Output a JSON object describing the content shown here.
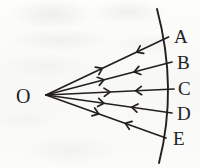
{
  "figure": {
    "ink_color": "#231f1e",
    "paper_color": "#fbfbfa"
  },
  "source_point": {
    "label": "O",
    "label_x": 16,
    "label_y": 86,
    "vertex_x": 46,
    "vertex_y": 95
  },
  "arc": {
    "name": "wavefront-arc",
    "path": "M 157 9 Q 178 88 159 163",
    "stroke_width": 1.9
  },
  "rays": [
    {
      "id": "ray-A",
      "label": "A",
      "x1": 46,
      "y1": 95,
      "x2": 168.5,
      "y2": 37,
      "arrow_out_t": 0.46,
      "arrow_in_t": 0.74,
      "label_x": 174,
      "label_y": 27,
      "label_size": 19
    },
    {
      "id": "ray-B",
      "label": "B",
      "x1": 46,
      "y1": 95,
      "x2": 172,
      "y2": 62,
      "arrow_out_t": 0.46,
      "arrow_in_t": 0.7,
      "label_x": 177,
      "label_y": 53,
      "label_size": 19
    },
    {
      "id": "ray-C",
      "label": "C",
      "x1": 46,
      "y1": 95,
      "x2": 174,
      "y2": 89,
      "arrow_out_t": 0.5,
      "arrow_in_t": 0.7,
      "label_x": 178,
      "label_y": 79,
      "label_size": 19
    },
    {
      "id": "ray-D",
      "label": "D",
      "x1": 46,
      "y1": 95,
      "x2": 172,
      "y2": 113,
      "arrow_out_t": 0.46,
      "arrow_in_t": 0.68,
      "label_x": 177,
      "label_y": 104,
      "label_size": 19
    },
    {
      "id": "ray-E",
      "label": "E",
      "x1": 46,
      "y1": 95,
      "x2": 166,
      "y2": 138,
      "arrow_out_t": 0.44,
      "arrow_in_t": 0.66,
      "label_x": 173,
      "label_y": 129,
      "label_size": 19
    }
  ]
}
